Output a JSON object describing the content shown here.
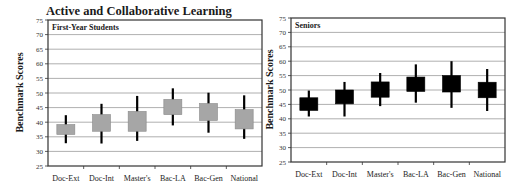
{
  "title": "Active and Collaborative Learning",
  "chart_data": [
    {
      "type": "box",
      "panel_title": "First-Year Students",
      "title": "Active and Collaborative Learning",
      "xlabel": "",
      "ylabel": "Benchmark Scores",
      "ylim": [
        25,
        75
      ],
      "yticks": [
        25,
        30,
        35,
        40,
        45,
        50,
        55,
        60,
        65,
        70,
        75
      ],
      "grid": true,
      "box_color": "#a6a6a6",
      "categories": [
        "Doc-Ext",
        "Doc-Int",
        "Master's",
        "Bac-LA",
        "Bac-Gen",
        "National"
      ],
      "whisker_low": [
        32.8,
        32.7,
        33.6,
        38.9,
        36.4,
        34.3
      ],
      "box_low": [
        35.8,
        36.9,
        36.9,
        42.6,
        40.6,
        37.7
      ],
      "box_high": [
        39.2,
        42.6,
        43.7,
        47.8,
        46.4,
        44.3
      ],
      "whisker_high": [
        42.4,
        46.3,
        49.0,
        51.6,
        50.1,
        49.2
      ]
    },
    {
      "type": "box",
      "panel_title": "Seniors",
      "title": "Active and Collaborative Learning",
      "xlabel": "",
      "ylabel": "Benchmark Scores",
      "ylim": [
        25,
        75
      ],
      "yticks": [
        25,
        30,
        35,
        40,
        45,
        50,
        55,
        60,
        65,
        70,
        75
      ],
      "grid": true,
      "box_color": "#000000",
      "categories": [
        "Doc-Ext",
        "Doc-Int",
        "Master's",
        "Bac-LA",
        "Bac-Gen",
        "National"
      ],
      "whisker_low": [
        40.8,
        40.8,
        44.4,
        45.6,
        43.8,
        42.7
      ],
      "box_low": [
        42.9,
        45.2,
        47.5,
        49.5,
        49.3,
        47.3
      ],
      "box_high": [
        47.3,
        50.0,
        52.8,
        54.5,
        55.0,
        52.7
      ],
      "whisker_high": [
        49.8,
        52.8,
        55.9,
        58.9,
        60.0,
        57.3
      ]
    }
  ]
}
